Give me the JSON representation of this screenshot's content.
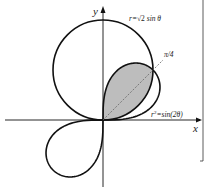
{
  "figure": {
    "type": "polar-curves-diagram",
    "axes": {
      "x_label": "x",
      "y_label": "y"
    },
    "curves": [
      {
        "name": "circle",
        "equation": "r=√2 sinθ",
        "label_r": "r=",
        "label_sqrt": "√2",
        "label_rest": " sin θ"
      },
      {
        "name": "lemniscate",
        "equation": "r²=sin(2θ)",
        "label_r": "r",
        "label_sup": "2",
        "label_rest": "=sin(2θ)"
      }
    ],
    "angle_line": {
      "label": "π/4"
    },
    "shaded_region": {
      "description": "region inside both curves in first quadrant",
      "fill": "#bdbdbd"
    },
    "colors": {
      "stroke": "#111111",
      "shade": "#bdbdbd",
      "dashed": "#666666"
    }
  }
}
